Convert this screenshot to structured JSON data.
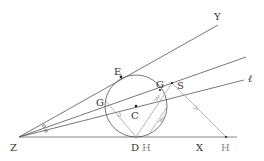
{
  "diagram": {
    "type": "geometry",
    "colors": {
      "line": "#555555",
      "light_line": "#999999",
      "point": "#222222",
      "label": "#333333"
    },
    "labels": {
      "Z": "Z",
      "Y": "Y",
      "X": "X",
      "ell": "ℓ",
      "E": "E",
      "G_left": "G",
      "G_right": "G",
      "C": "C",
      "D": "D",
      "H_near": "H",
      "H_far": "H",
      "S": "S"
    },
    "points": {
      "Z": [
        19,
        137
      ],
      "Y_end": [
        218,
        25
      ],
      "X_end": [
        237,
        137
      ],
      "upper_end": [
        246,
        57
      ],
      "ell_end": [
        244,
        80
      ],
      "C": [
        136,
        106
      ],
      "E": [
        121,
        77
      ],
      "D": [
        136,
        137
      ],
      "G_left": [
        106,
        101
      ],
      "S_vertex": [
        172,
        83
      ],
      "H_far": [
        226,
        137
      ],
      "H_near": [
        147,
        137
      ]
    },
    "circle": {
      "center": [
        136,
        106
      ],
      "radius": 31
    },
    "angle_marks": [
      "equal-angle-circle-1",
      "equal-angle-circle-2"
    ]
  }
}
